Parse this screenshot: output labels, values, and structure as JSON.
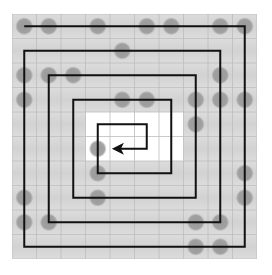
{
  "diagram": {
    "type": "spiral-grid",
    "grid": {
      "rows": 10,
      "cols": 10,
      "cell_size": 24.5,
      "background_color": "#d2d2d2",
      "band_light_color": "#dcdcdc",
      "grid_line_color": "#bdbdbd",
      "highlight_color": "#ffffff",
      "highlight_region": {
        "row_start": 4,
        "row_end": 5,
        "col_start": 3,
        "col_end": 6
      }
    },
    "markers": {
      "color": "#9a9a9a",
      "radius": 7.5,
      "cells": [
        [
          0,
          0
        ],
        [
          0,
          1
        ],
        [
          0,
          3
        ],
        [
          0,
          5
        ],
        [
          0,
          6
        ],
        [
          0,
          8
        ],
        [
          0,
          9
        ],
        [
          1,
          4
        ],
        [
          2,
          0
        ],
        [
          2,
          1
        ],
        [
          2,
          2
        ],
        [
          2,
          8
        ],
        [
          3,
          0
        ],
        [
          3,
          4
        ],
        [
          3,
          5
        ],
        [
          3,
          7
        ],
        [
          3,
          8
        ],
        [
          3,
          9
        ],
        [
          4,
          7
        ],
        [
          5,
          3
        ],
        [
          6,
          3
        ],
        [
          6,
          9
        ],
        [
          7,
          0
        ],
        [
          7,
          3
        ],
        [
          7,
          9
        ],
        [
          8,
          0
        ],
        [
          8,
          1
        ],
        [
          8,
          7
        ],
        [
          8,
          8
        ],
        [
          9,
          7
        ],
        [
          9,
          8
        ]
      ]
    },
    "spiral": {
      "color": "#111111",
      "stroke_width": 2,
      "path_cells": [
        [
          0,
          0
        ],
        [
          0,
          9
        ],
        [
          9,
          9
        ],
        [
          9,
          0
        ],
        [
          1,
          0
        ],
        [
          1,
          8
        ],
        [
          8,
          8
        ],
        [
          8,
          1
        ],
        [
          2,
          1
        ],
        [
          2,
          7
        ],
        [
          7,
          7
        ],
        [
          7,
          2
        ],
        [
          3,
          2
        ],
        [
          3,
          6
        ],
        [
          6,
          6
        ],
        [
          6,
          3
        ],
        [
          4,
          3
        ],
        [
          4,
          5
        ],
        [
          5,
          5
        ]
      ],
      "end_point": {
        "row": 5,
        "col": 3.7
      },
      "arrow_direction": "left"
    }
  }
}
